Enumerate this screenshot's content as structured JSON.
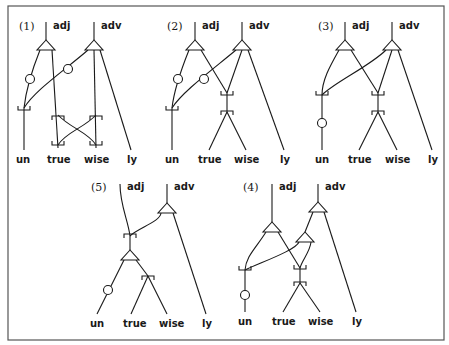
{
  "figure": {
    "panels": [
      {
        "id": "1",
        "number_label": "(1)",
        "roots": [
          "adj",
          "adv"
        ],
        "leaves": [
          "un",
          "true",
          "wise",
          "ly"
        ]
      },
      {
        "id": "2",
        "number_label": "(2)",
        "roots": [
          "adj",
          "adv"
        ],
        "leaves": [
          "un",
          "true",
          "wise",
          "ly"
        ]
      },
      {
        "id": "3",
        "number_label": "(3)",
        "roots": [
          "adj",
          "adv"
        ],
        "leaves": [
          "un",
          "true",
          "wise",
          "ly"
        ]
      },
      {
        "id": "5",
        "number_label": "(5)",
        "roots": [
          "adj",
          "adv"
        ],
        "leaves": [
          "un",
          "true",
          "wise",
          "ly"
        ]
      },
      {
        "id": "4",
        "number_label": "(4)",
        "roots": [
          "adj",
          "adv"
        ],
        "leaves": [
          "un",
          "true",
          "wise",
          "ly"
        ]
      }
    ]
  },
  "colors": {
    "ink": "#1a1a1a",
    "frame": "#555555",
    "background": "#ffffff"
  }
}
